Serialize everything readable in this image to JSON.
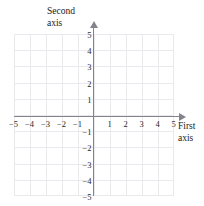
{
  "chart_data": {
    "type": "scatter",
    "title": "",
    "xlabel": "First axis",
    "ylabel": "Second axis",
    "xlim": [
      -5.5,
      5.5
    ],
    "ylim": [
      -5.5,
      5.5
    ],
    "grid": true,
    "legend": null,
    "series": [],
    "x_ticks": [
      -5,
      -4,
      -3,
      -2,
      -1,
      1,
      2,
      3,
      4,
      5
    ],
    "y_ticks": [
      5,
      4,
      3,
      2,
      1,
      -1,
      -2,
      -3,
      -4,
      -5
    ],
    "x_tick_labels": [
      "−5",
      "−4",
      "−3",
      "−2",
      "−1",
      "1",
      "2",
      "3",
      "4",
      "5"
    ],
    "y_tick_labels": [
      "5",
      "4",
      "3",
      "2",
      "1",
      "−1",
      "−2",
      "−3",
      "−4",
      "−5"
    ],
    "annotations": []
  },
  "axes": {
    "horizontal": {
      "title_line1": "First",
      "title_line2": "axis",
      "arrow": "arrow-right"
    },
    "vertical": {
      "title_line1": "Second",
      "title_line2": "axis",
      "arrow": "arrow-up"
    }
  },
  "style": {
    "background": "#ffffff",
    "grid_color": "#e9e9ee",
    "axis_color": "#83838b",
    "label_color": "#2b2b2b"
  }
}
